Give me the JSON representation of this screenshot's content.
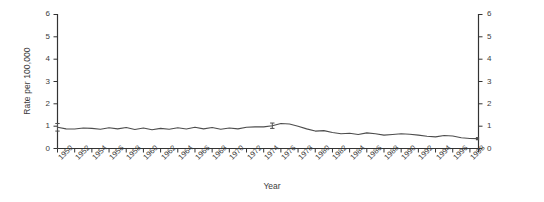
{
  "chart_data": {
    "type": "line",
    "title": "",
    "xlabel": "Year",
    "ylabel": "Rate per 100,000",
    "xlim": [
      1950,
      1999
    ],
    "ylim": [
      0,
      6
    ],
    "yticks": [
      0,
      1,
      2,
      3,
      4,
      5,
      6
    ],
    "ytick_labels": [
      "0",
      "1",
      "2",
      "3",
      "4",
      "5",
      "6"
    ],
    "yticks_right": [
      0,
      1,
      2,
      3,
      4,
      5,
      6
    ],
    "ytick_labels_right": [
      "0",
      "1",
      "2",
      "3",
      "4",
      "5",
      "6"
    ],
    "xticks": [
      1950,
      1952,
      1954,
      1956,
      1958,
      1960,
      1962,
      1964,
      1966,
      1968,
      1970,
      1972,
      1974,
      1976,
      1978,
      1980,
      1982,
      1984,
      1986,
      1988,
      1990,
      1992,
      1994,
      1996,
      1998
    ],
    "xtick_labels": [
      "1950",
      "1952",
      "1954",
      "1956",
      "1958",
      "1960",
      "1962",
      "1964",
      "1966",
      "1968",
      "1970",
      "1972",
      "1974",
      "1976",
      "1978",
      "1980",
      "1982",
      "1984",
      "1986",
      "1988",
      "1990",
      "1992",
      "1994",
      "1996",
      "1998"
    ],
    "grid": false,
    "legend": null,
    "line_color": "#4d4d4d",
    "line_width": 1.1,
    "x": [
      1950,
      1951,
      1952,
      1953,
      1954,
      1955,
      1956,
      1957,
      1958,
      1959,
      1960,
      1961,
      1962,
      1963,
      1964,
      1965,
      1966,
      1967,
      1968,
      1969,
      1970,
      1971,
      1972,
      1973,
      1974,
      1975,
      1976,
      1977,
      1978,
      1979,
      1980,
      1981,
      1982,
      1983,
      1984,
      1985,
      1986,
      1987,
      1988,
      1989,
      1990,
      1991,
      1992,
      1993,
      1994,
      1995,
      1996,
      1997,
      1998,
      1999
    ],
    "values": [
      0.95,
      0.88,
      0.87,
      0.92,
      0.9,
      0.86,
      0.93,
      0.88,
      0.94,
      0.85,
      0.92,
      0.84,
      0.9,
      0.86,
      0.93,
      0.87,
      0.95,
      0.88,
      0.94,
      0.86,
      0.92,
      0.88,
      0.95,
      0.97,
      0.97,
      1.02,
      1.12,
      1.1,
      1.0,
      0.88,
      0.78,
      0.8,
      0.72,
      0.66,
      0.68,
      0.63,
      0.7,
      0.66,
      0.6,
      0.63,
      0.66,
      0.64,
      0.6,
      0.55,
      0.52,
      0.58,
      0.56,
      0.48,
      0.45,
      0.44
    ],
    "error_bars": [
      {
        "x": 1950,
        "y": 0.95,
        "low": 0.78,
        "high": 1.12
      },
      {
        "x": 1975,
        "y": 1.02,
        "low": 0.9,
        "high": 1.14
      }
    ],
    "end_marker": {
      "x": 1999,
      "y": 0.44,
      "shape": "square"
    }
  },
  "axes": {
    "left_axis_name": "left-value-axis",
    "right_axis_name": "right-value-axis",
    "bottom_axis_name": "year-axis"
  }
}
